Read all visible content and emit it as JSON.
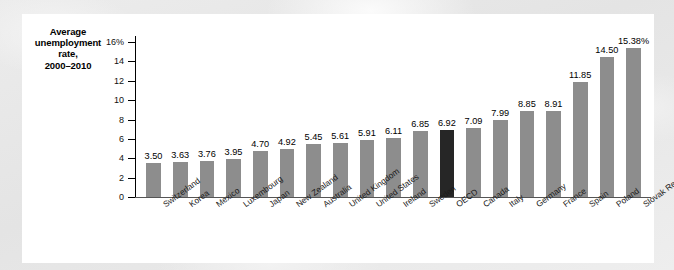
{
  "figure": {
    "axis_title_lines": [
      "Average",
      "unemployment",
      "rate,",
      "2000–2010"
    ]
  },
  "chart_data": {
    "type": "bar",
    "title": "Average unemployment rate, 2000–2010",
    "xlabel": "",
    "ylabel": "Average unemployment rate, 2000–2010",
    "ylim": [
      0,
      16
    ],
    "yticks": [
      0,
      2,
      4,
      6,
      8,
      10,
      12,
      14,
      16
    ],
    "ytick_labels": [
      "0",
      "2",
      "4",
      "6",
      "8",
      "10",
      "12",
      "14",
      "16%"
    ],
    "grid": false,
    "legend": null,
    "highlight_category": "OECD",
    "highlight_color": "#262626",
    "bar_color": "#8d8d8d",
    "categories": [
      "Switzerland",
      "Korea",
      "Mexico",
      "Luxembourg",
      "Japan",
      "New Zealand",
      "Australia",
      "United Kingdom",
      "United States",
      "Ireland",
      "Sweden",
      "OECD",
      "Canada",
      "Italy",
      "Germany",
      "France",
      "Spain",
      "Poland",
      "Slovak Republic"
    ],
    "values": [
      3.5,
      3.63,
      3.76,
      3.95,
      4.7,
      4.92,
      5.45,
      5.61,
      5.91,
      6.11,
      6.85,
      6.92,
      7.09,
      7.99,
      8.85,
      8.91,
      11.85,
      14.5,
      15.38
    ],
    "data_labels": [
      "3.50",
      "3.63",
      "3.76",
      "3.95",
      "4.70",
      "4.92",
      "5.45",
      "5.61",
      "5.91",
      "6.11",
      "6.85",
      "6.92",
      "7.09",
      "7.99",
      "8.85",
      "8.91",
      "11.85",
      "14.50",
      "15.38%"
    ]
  }
}
